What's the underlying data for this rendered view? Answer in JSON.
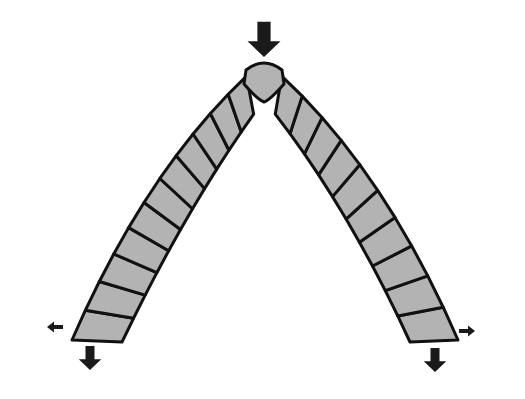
{
  "diagram": {
    "title": "Pointed arch of voussoir blocks under load",
    "colors": {
      "block_fill": "#b3b3b3",
      "outline": "#111111",
      "arrow": "#1a1a1a",
      "background": "#ffffff"
    },
    "keystone": {
      "x": 264,
      "y": 80
    },
    "left_leg": {
      "blocks": 11,
      "base": {
        "x": 95,
        "y": 335
      }
    },
    "right_leg": {
      "blocks": 10,
      "base": {
        "x": 432,
        "y": 335
      }
    },
    "forces": [
      {
        "name": "top-load",
        "direction": "down",
        "x": 264,
        "y": 35,
        "size": "large"
      },
      {
        "name": "left-vertical-reaction",
        "direction": "down",
        "x": 90,
        "y": 358,
        "size": "medium"
      },
      {
        "name": "left-horizontal-thrust",
        "direction": "left",
        "x": 57,
        "y": 327,
        "size": "small"
      },
      {
        "name": "right-vertical-reaction",
        "direction": "down",
        "x": 435,
        "y": 360,
        "size": "medium"
      },
      {
        "name": "right-horizontal-thrust",
        "direction": "right",
        "x": 465,
        "y": 331,
        "size": "small"
      }
    ]
  }
}
